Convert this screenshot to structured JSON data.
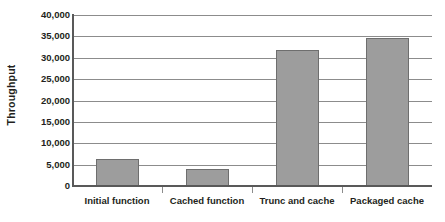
{
  "chart_data": {
    "type": "bar",
    "title": "",
    "xlabel": "",
    "ylabel": "Throughput",
    "categories": [
      "Initial function",
      "Cached function",
      "Trunc and cache",
      "Packaged cache"
    ],
    "values": [
      6300,
      3980,
      31900,
      34700
    ],
    "ylim": [
      0,
      40000
    ],
    "y_ticks": [
      0,
      5000,
      10000,
      15000,
      20000,
      25000,
      30000,
      35000,
      40000
    ],
    "y_tick_labels": [
      "0",
      "5,000",
      "10,000",
      "15,000",
      "20,000",
      "25,000",
      "30,000",
      "35,000",
      "40,000"
    ],
    "grid": true,
    "legend": false,
    "legend_position": "none",
    "colors": {
      "bar_fill": "#9d9d9d",
      "bar_edge": "#6e6e6e",
      "gridline": "#8c8c8c",
      "axis": "#595959",
      "text": "#231f20",
      "background": "#ffffff"
    }
  }
}
